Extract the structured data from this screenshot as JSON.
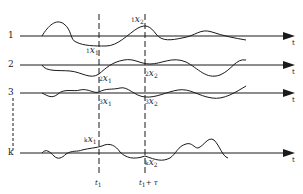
{
  "diagram": {
    "type": "ensemble of random process realizations",
    "realizations": [
      {
        "label": "1",
        "axis_y": 36
      },
      {
        "label": "2",
        "axis_y": 65
      },
      {
        "label": "3",
        "axis_y": 93
      },
      {
        "label": "k",
        "axis_y": 153
      }
    ],
    "axis_label": "t",
    "samples": {
      "r1_x1": {
        "pre": "1",
        "var": "x",
        "sub": "1"
      },
      "r1_x2": {
        "pre": "1",
        "var": "x",
        "sub": "2"
      },
      "r2_x1": {
        "pre": "2",
        "var": "x",
        "sub": "1"
      },
      "r2_x2": {
        "pre": "2",
        "var": "x",
        "sub": "2"
      },
      "r3_x1": {
        "pre": "3",
        "var": "x",
        "sub": "1"
      },
      "r3_x2": {
        "pre": "3",
        "var": "x",
        "sub": "2"
      },
      "rk_x1": {
        "pre": "k",
        "var": "x",
        "sub": "1"
      },
      "rk_x2": {
        "pre": "k",
        "var": "x",
        "sub": "2"
      }
    },
    "time_markers": {
      "t1": {
        "var": "t",
        "sub": "1"
      },
      "t2": {
        "var": "t",
        "sub": "1",
        "suffix": "+ τ"
      }
    }
  }
}
